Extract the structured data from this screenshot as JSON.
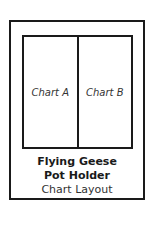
{
  "diagram": {
    "panels": [
      {
        "label": "Chart A"
      },
      {
        "label": "Chart B"
      }
    ],
    "caption": {
      "line1": "Flying Geese",
      "line2": "Pot Holder",
      "line3": "Chart Layout"
    },
    "colors": {
      "stroke": "#1a1a1a",
      "background": "#ffffff"
    }
  }
}
